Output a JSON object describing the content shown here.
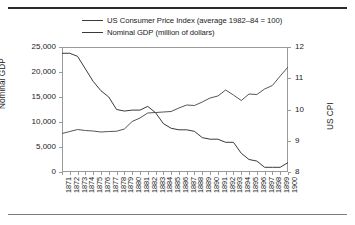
{
  "chart_data": {
    "type": "line",
    "title": "",
    "xlabel": "",
    "grid": false,
    "legend_position": "top",
    "x": [
      1871,
      1872,
      1873,
      1874,
      1875,
      1876,
      1877,
      1878,
      1879,
      1880,
      1881,
      1882,
      1883,
      1884,
      1885,
      1886,
      1887,
      1888,
      1889,
      1890,
      1891,
      1892,
      1893,
      1894,
      1895,
      1896,
      1897,
      1898,
      1899,
      1900
    ],
    "categories": [
      "1871",
      "1872",
      "1873",
      "1874",
      "1875",
      "1876",
      "1877",
      "1878",
      "1879",
      "1880",
      "1881",
      "1882",
      "1883",
      "1884",
      "1885",
      "1886",
      "1887",
      "1888",
      "1889",
      "1890",
      "1891",
      "1892",
      "1893",
      "1894",
      "1895",
      "1896",
      "1897",
      "1898",
      "1899",
      "1900"
    ],
    "axes": {
      "left": {
        "label": "Nominal GDP",
        "ticks": [
          0,
          5000,
          10000,
          15000,
          20000,
          25000
        ],
        "tick_labels": [
          "0",
          "5,000",
          "10,000",
          "15,000",
          "20,000",
          "25,000"
        ],
        "ylim": [
          0,
          25000
        ]
      },
      "right": {
        "label": "US CPI",
        "ticks": [
          8,
          9,
          10,
          11,
          12
        ],
        "tick_labels": [
          "8",
          "9",
          "10",
          "11",
          "12"
        ],
        "ylim": [
          8,
          12
        ]
      }
    },
    "series": [
      {
        "name": "US Consumer Price Index (average 1982–84 = 100)",
        "axis": "right",
        "color": "#3a3a3a",
        "values": [
          11.8,
          11.8,
          11.7,
          11.3,
          10.9,
          10.6,
          10.4,
          10.0,
          9.95,
          9.98,
          9.98,
          10.1,
          9.9,
          9.55,
          9.4,
          9.35,
          9.35,
          9.3,
          9.1,
          9.05,
          9.05,
          8.95,
          8.95,
          8.6,
          8.4,
          8.35,
          8.15,
          8.15,
          8.15,
          8.3
        ]
      },
      {
        "name": "Nominal GDP (million of dollars)",
        "axis": "left",
        "color": "#555555",
        "values": [
          7700,
          8100,
          8500,
          8300,
          8200,
          8000,
          8100,
          8150,
          8600,
          10100,
          10800,
          11800,
          11900,
          12000,
          12100,
          12800,
          13400,
          13300,
          14000,
          14800,
          15200,
          16400,
          15400,
          14300,
          15600,
          15500,
          16600,
          17300,
          19200,
          21000
        ]
      }
    ]
  }
}
